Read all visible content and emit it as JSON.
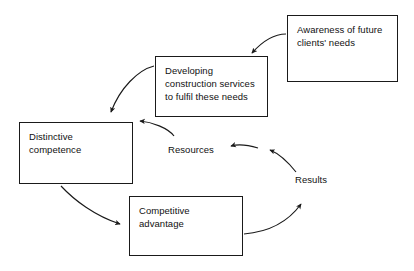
{
  "diagram": {
    "background_color": "#ffffff",
    "stroke_color": "#1a1a1a",
    "text_color": "#111111",
    "nodes": [
      {
        "id": "awareness",
        "label": "Awareness of future\nclients' needs"
      },
      {
        "id": "developing",
        "label": "Developing\nconstruction services\nto fulfil these needs"
      },
      {
        "id": "distinctive",
        "label": "Distinctive\ncompetence"
      },
      {
        "id": "competitive",
        "label": "Competitive\nadvantage"
      }
    ],
    "labels": [
      {
        "id": "resources",
        "label": "Resources"
      },
      {
        "id": "results",
        "label": "Results"
      }
    ],
    "connections": [
      {
        "from": "awareness",
        "to": "developing"
      },
      {
        "from": "developing",
        "to": "distinctive"
      },
      {
        "from": "resources",
        "to": "distinctive"
      },
      {
        "from": "distinctive",
        "to": "competitive"
      },
      {
        "from": "competitive",
        "to": "results"
      },
      {
        "from": "results",
        "to": "resources"
      }
    ]
  }
}
